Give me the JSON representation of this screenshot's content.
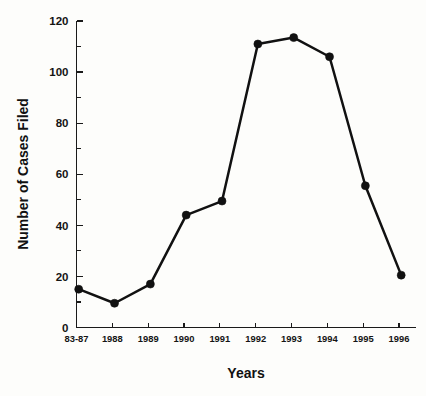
{
  "chart_data": {
    "type": "line",
    "title": "",
    "xlabel": "Years",
    "ylabel": "Number of Cases Filed",
    "categories": [
      "83-87",
      "1988",
      "1989",
      "1990",
      "1991",
      "1992",
      "1993",
      "1994",
      "1995",
      "1996"
    ],
    "values": [
      15,
      9.5,
      17,
      44,
      49.5,
      111,
      113.5,
      106,
      55.5,
      20.5
    ],
    "series": [
      {
        "name": "Number of Cases Filed",
        "values": [
          15,
          9.5,
          17,
          44,
          49.5,
          111,
          113.5,
          106,
          55.5,
          20.5
        ]
      }
    ],
    "ylim": [
      0,
      120
    ],
    "y_major_ticks": [
      0,
      20,
      40,
      60,
      80,
      100,
      120
    ],
    "y_major_tick_labels": [
      "0",
      "20",
      "40",
      "60",
      "80",
      "100",
      "120"
    ],
    "y_minor_ticks": [
      10,
      30,
      50,
      70,
      90,
      110
    ],
    "grid": false,
    "legend": false,
    "legend_position": "none",
    "marker": "filled-circle",
    "line_color": "#111111",
    "marker_color": "#111111",
    "background_color": "#fdfdfb",
    "axis_color": "#1a1a1a"
  }
}
